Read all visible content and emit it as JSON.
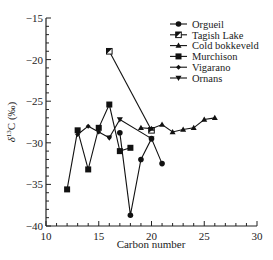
{
  "chart_data": {
    "type": "line",
    "title": "",
    "xlabel": "Carbon number",
    "ylabel": "δ13C (‰)",
    "xlim": [
      10,
      30
    ],
    "ylim": [
      -40,
      -15
    ],
    "xticks": [
      10,
      15,
      20,
      25,
      30
    ],
    "yticks": [
      -15,
      -20,
      -25,
      -30,
      -35,
      -40
    ],
    "grid": false,
    "legend_position": "top-right",
    "series": [
      {
        "name": "Orgueil",
        "marker": "circle",
        "x": [
          17,
          18,
          19,
          20,
          21
        ],
        "values": [
          -28.8,
          -38.7,
          -32.0,
          -29.5,
          -32.5
        ]
      },
      {
        "name": "Tagish Lake",
        "marker": "flag-square",
        "x": [
          16,
          20
        ],
        "values": [
          -19.0,
          -28.5
        ]
      },
      {
        "name": "Cold bokkeveld",
        "marker": "triangle-up",
        "x": [
          19,
          20,
          21,
          22,
          23,
          24,
          25,
          26
        ],
        "values": [
          -28.2,
          -28.3,
          -27.8,
          -28.7,
          -28.4,
          -28.2,
          -27.2,
          -27.0
        ]
      },
      {
        "name": "Murchison",
        "marker": "square",
        "x": [
          12,
          13,
          14,
          15,
          16,
          17,
          18
        ],
        "values": [
          -35.6,
          -28.5,
          -33.2,
          -28.2,
          -25.4,
          -31.0,
          -30.6
        ]
      },
      {
        "name": "Vigarano",
        "marker": "diamond",
        "x": [
          13,
          14,
          15,
          16
        ],
        "values": [
          -29.0,
          -28.0,
          -28.7,
          -29.4
        ]
      },
      {
        "name": "Ornans",
        "marker": "triangle-down",
        "x": [
          16,
          17,
          20
        ],
        "values": [
          -29.4,
          -27.2,
          -29.5
        ]
      }
    ]
  }
}
